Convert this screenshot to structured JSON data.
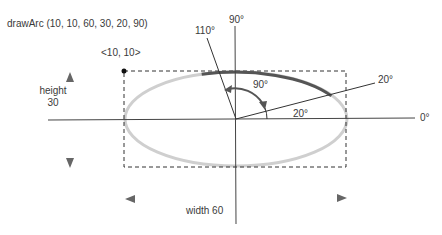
{
  "title": "drawArc (10, 10, 60, 30, 20, 90)",
  "origin_label": "<10, 10>",
  "height_label_line1": "height",
  "height_label_line2": "30",
  "width_label": "width 60",
  "angles": {
    "deg0": "0°",
    "deg90": "90°",
    "deg110": "110°",
    "deg20_line": "20°",
    "deg20_arc": "20°",
    "sweep90": "90°"
  },
  "colors": {
    "arc": "#555555",
    "ellipse": "#cccccc",
    "axis": "#333333"
  }
}
